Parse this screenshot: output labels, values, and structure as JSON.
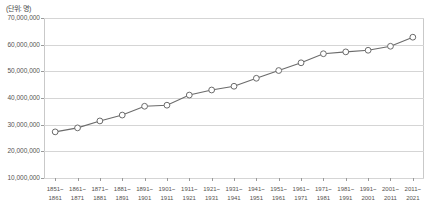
{
  "chart_data": {
    "type": "line",
    "title": "",
    "subtitle": "",
    "unit_label": "(단위: 명)",
    "xlabel": "",
    "ylabel": "",
    "ylim": [
      10000000,
      70000000
    ],
    "ytick_labels": [
      "70,000,000",
      "60,000,000",
      "50,000,000",
      "40,000,000",
      "30,000,000",
      "20,000,000",
      "10,000,000"
    ],
    "ytick_values": [
      70000000,
      60000000,
      50000000,
      40000000,
      30000000,
      20000000,
      10000000
    ],
    "grid": true,
    "legend": "none",
    "marker": "open-circle",
    "line_color": "#6b6b6b",
    "marker_fill": "#ffffff",
    "marker_stroke": "#6b6b6b",
    "grid_color": "#d5d5d5",
    "categories": [
      "1851~\n1861",
      "1861~\n1871",
      "1871~\n1881",
      "1881~\n1891",
      "1891~\n1901",
      "1901~\n1911",
      "1911~\n1921",
      "1921~\n1931",
      "1931~\n1941",
      "1941~\n1951",
      "1951~\n1961",
      "1961~\n1971",
      "1971~\n1981",
      "1981~\n1991",
      "1991~\n2001",
      "2001~\n2011",
      "2011~\n2021"
    ],
    "categories_top": [
      "1851~",
      "1861~",
      "1871~",
      "1881~",
      "1891~",
      "1901~",
      "1911~",
      "1921~",
      "1931~",
      "1941~",
      "1951~",
      "1961~",
      "1971~",
      "1981~",
      "1991~",
      "2001~",
      "2011~"
    ],
    "categories_bottom": [
      "1861",
      "1871",
      "1881",
      "1891",
      "1901",
      "1911",
      "1921",
      "1931",
      "1941",
      "1951",
      "1961",
      "1971",
      "1981",
      "1991",
      "2001",
      "2011",
      "2021"
    ],
    "values": [
      27300000,
      28800000,
      31400000,
      33600000,
      36900000,
      37300000,
      41100000,
      43000000,
      44400000,
      47400000,
      50300000,
      53200000,
      56600000,
      57300000,
      57900000,
      59400000,
      62800000
    ]
  }
}
